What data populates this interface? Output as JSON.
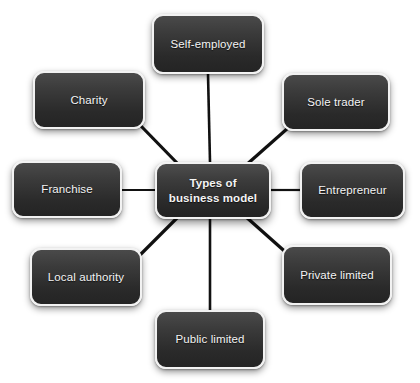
{
  "diagram": {
    "type": "hub-and-spoke-mind-map",
    "background_color": "#ffffff",
    "node_fill_top": "#4a4a4a",
    "node_fill_bottom": "#242424",
    "node_border_color": "#f2f2f2",
    "node_text_color": "#f4f4f4",
    "connector_color": "#111111",
    "central": {
      "label": "Types of\nbusiness model",
      "line1": "Types of",
      "line2": "business model",
      "x": 155,
      "y": 162,
      "width": 116,
      "height": 57
    },
    "nodes": [
      {
        "id": "self-employed",
        "label": "Self-employed",
        "x": 152,
        "y": 14,
        "width": 112,
        "height": 60,
        "connector": {
          "x1": 208,
          "y1": 74,
          "x2": 210,
          "y2": 162,
          "thickness": 2.6
        }
      },
      {
        "id": "sole-trader",
        "label": "Sole trader",
        "x": 282,
        "y": 73,
        "width": 108,
        "height": 58,
        "connector": {
          "x1": 288,
          "y1": 128,
          "x2": 245,
          "y2": 166,
          "thickness": 3.2
        }
      },
      {
        "id": "entrepreneur",
        "label": "Entrepreneur",
        "x": 300,
        "y": 162,
        "width": 105,
        "height": 57,
        "connector": {
          "x1": 271,
          "y1": 190,
          "x2": 300,
          "y2": 190,
          "thickness": 2.2
        }
      },
      {
        "id": "private-limited",
        "label": "Private limited",
        "x": 282,
        "y": 245,
        "width": 110,
        "height": 60,
        "connector": {
          "x1": 245,
          "y1": 216,
          "x2": 290,
          "y2": 256,
          "thickness": 3.2
        }
      },
      {
        "id": "public-limited",
        "label": "Public limited",
        "x": 155,
        "y": 310,
        "width": 110,
        "height": 59,
        "connector": {
          "x1": 210,
          "y1": 219,
          "x2": 210,
          "y2": 310,
          "thickness": 2.6
        }
      },
      {
        "id": "local-authority",
        "label": "Local authority",
        "x": 30,
        "y": 248,
        "width": 112,
        "height": 58,
        "connector": {
          "x1": 178,
          "y1": 217,
          "x2": 139,
          "y2": 256,
          "thickness": 3.2
        }
      },
      {
        "id": "franchise",
        "label": "Franchise",
        "x": 12,
        "y": 161,
        "width": 110,
        "height": 57,
        "connector": {
          "x1": 122,
          "y1": 190,
          "x2": 155,
          "y2": 190,
          "thickness": 2.2
        }
      },
      {
        "id": "charity",
        "label": "Charity",
        "x": 33,
        "y": 71,
        "width": 112,
        "height": 58,
        "connector": {
          "x1": 140,
          "y1": 125,
          "x2": 179,
          "y2": 165,
          "thickness": 3.2
        }
      }
    ]
  }
}
